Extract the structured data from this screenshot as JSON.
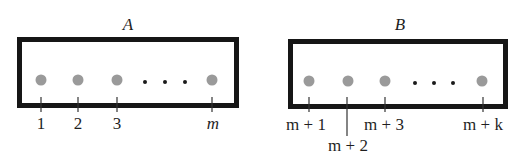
{
  "colors": {
    "box_border": "#161616",
    "dot": "#9a9a9a",
    "ellipsis_dot": "#1a1a1a",
    "tick": "#333333",
    "text": "#1f1f1f"
  },
  "boxes": [
    {
      "title": "A",
      "elements": [
        {
          "label": "1"
        },
        {
          "label": "2"
        },
        {
          "label": "3"
        },
        {
          "label": "m"
        }
      ],
      "ellipsis": "…"
    },
    {
      "title": "B",
      "elements": [
        {
          "label": "m + 1"
        },
        {
          "label": "m + 2"
        },
        {
          "label": "m + 3"
        },
        {
          "label": "m + k"
        }
      ],
      "ellipsis": "…"
    }
  ]
}
